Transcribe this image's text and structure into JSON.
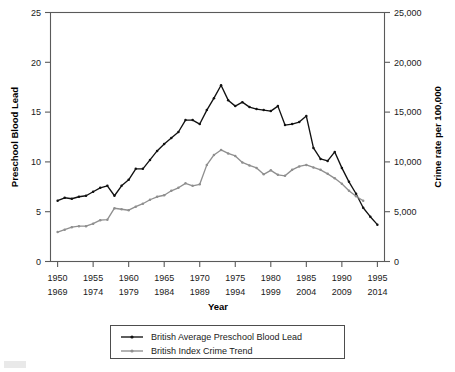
{
  "chart_data": {
    "type": "line",
    "title": "",
    "xlabel": "Year",
    "ylabel": "Preschool Blood Lead",
    "y2label": "Crime rate per 100,000",
    "grid": false,
    "legend_position": "bottom",
    "ylim": [
      0,
      25
    ],
    "y2lim": [
      0,
      25000
    ],
    "xlim": [
      1949,
      1996
    ],
    "y_ticks": [
      "0",
      "5",
      "10",
      "15",
      "20",
      "25"
    ],
    "y_tick_values": [
      0,
      5,
      10,
      15,
      20,
      25
    ],
    "y2_ticks": [
      "0",
      "5,000",
      "10,000",
      "15,000",
      "20,000",
      "25,000"
    ],
    "y2_tick_values": [
      0,
      5000,
      10000,
      15000,
      20000,
      25000
    ],
    "x_ticks_top": [
      "1950",
      "1955",
      "1960",
      "1965",
      "1970",
      "1975",
      "1980",
      "1985",
      "1990",
      "1995"
    ],
    "x_ticks_bottom": [
      "1969",
      "1974",
      "1979",
      "1984",
      "1989",
      "1994",
      "1999",
      "2004",
      "2009",
      "2014"
    ],
    "x_tick_values": [
      1950,
      1955,
      1960,
      1965,
      1970,
      1975,
      1980,
      1985,
      1990,
      1995
    ],
    "series": [
      {
        "name": "British Average Preschool Blood Lead",
        "color": "#111111",
        "axis": "left",
        "x": [
          1950,
          1951,
          1952,
          1953,
          1954,
          1955,
          1956,
          1957,
          1958,
          1959,
          1960,
          1961,
          1962,
          1963,
          1964,
          1965,
          1966,
          1967,
          1968,
          1969,
          1970,
          1971,
          1972,
          1973,
          1974,
          1975,
          1976,
          1977,
          1978,
          1979,
          1980,
          1981,
          1982,
          1983,
          1984,
          1985,
          1986,
          1987,
          1988,
          1989,
          1990,
          1991,
          1992,
          1993,
          1994,
          1995
        ],
        "values": [
          6.1,
          6.4,
          6.3,
          6.5,
          6.6,
          7.0,
          7.4,
          7.6,
          6.6,
          7.6,
          8.2,
          9.3,
          9.3,
          10.2,
          11.1,
          11.8,
          12.4,
          13.0,
          14.2,
          14.2,
          13.8,
          15.2,
          16.4,
          17.7,
          16.2,
          15.6,
          16.0,
          15.5,
          15.3,
          15.2,
          15.1,
          15.6,
          13.7,
          13.8,
          14.0,
          14.6,
          11.4,
          10.3,
          10.1,
          11.0,
          9.4,
          8.0,
          6.8,
          5.4,
          4.5,
          3.7
        ]
      },
      {
        "name": "British Index Crime Trend",
        "color": "#8f8f8f",
        "axis": "right",
        "x": [
          1950,
          1951,
          1952,
          1953,
          1954,
          1955,
          1956,
          1957,
          1958,
          1959,
          1960,
          1961,
          1962,
          1963,
          1964,
          1965,
          1966,
          1967,
          1968,
          1969,
          1970,
          1971,
          1972,
          1973,
          1974,
          1975,
          1976,
          1977,
          1978,
          1979,
          1980,
          1981,
          1982,
          1983,
          1984,
          1985,
          1986,
          1987,
          1988,
          1989,
          1990,
          1991,
          1992,
          1993
        ],
        "values": [
          2950,
          3200,
          3450,
          3550,
          3550,
          3800,
          4150,
          4200,
          5350,
          5250,
          5150,
          5500,
          5800,
          6200,
          6500,
          6650,
          7100,
          7400,
          7850,
          7600,
          7750,
          9700,
          10700,
          11200,
          10850,
          10600,
          9950,
          9650,
          9400,
          8750,
          9150,
          8700,
          8600,
          9200,
          9550,
          9700,
          9450,
          9200,
          8800,
          8350,
          7800,
          7100,
          6550,
          6100
        ]
      }
    ]
  },
  "legend": {
    "items": [
      {
        "label": "British Average Preschool Blood Lead",
        "color": "#111111"
      },
      {
        "label": "British Index Crime Trend",
        "color": "#8f8f8f"
      }
    ]
  },
  "axes": {
    "left_title": "Preschool Blood Lead",
    "right_title": "Crime rate per 100,000",
    "x_title": "Year"
  }
}
